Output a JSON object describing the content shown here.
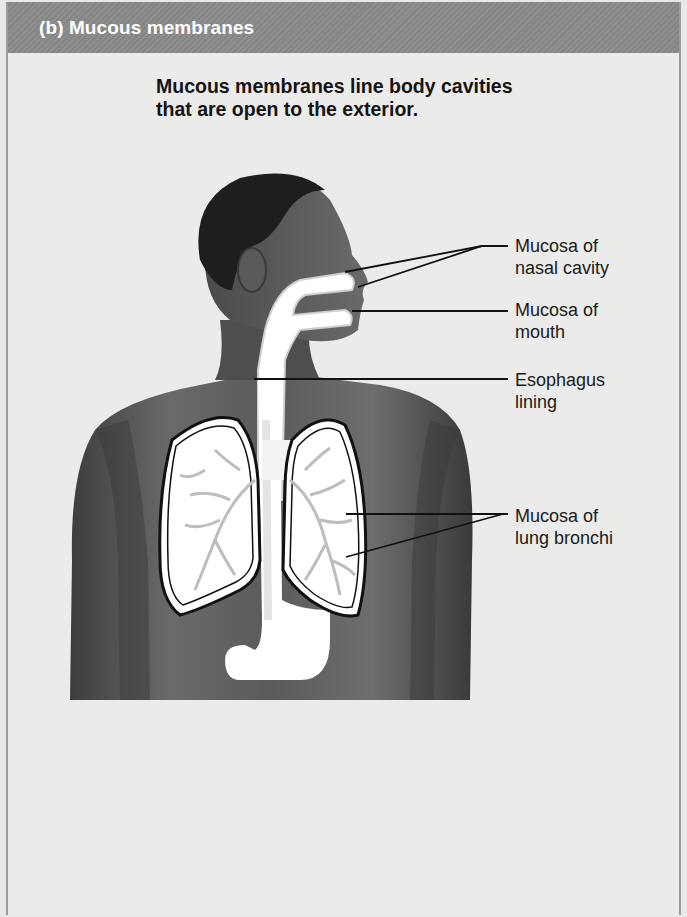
{
  "header": {
    "title": "(b) Mucous membranes",
    "background_color": "#8a8a8a"
  },
  "subtitle": {
    "line1": "Mucous membranes line body cavities",
    "line2": "that are open to the exterior."
  },
  "figure": {
    "skin_color": "#555555",
    "mucosa_color": "#ffffff",
    "bronchi_color": "#bdbdbd"
  },
  "labels": [
    {
      "id": "nasal",
      "line1": "Mucosa of",
      "line2": "nasal cavity",
      "x": 515,
      "y": 235,
      "leaders": [
        {
          "x1": 345,
          "y1": 272,
          "xm": 482,
          "ym": 246,
          "x2": 508,
          "y2": 246
        },
        {
          "x1": 358,
          "y1": 287,
          "xm": 482,
          "ym": 246,
          "x2": 508,
          "y2": 246
        }
      ]
    },
    {
      "id": "mouth",
      "line1": "Mucosa of",
      "line2": "mouth",
      "x": 515,
      "y": 299,
      "leaders": [
        {
          "x1": 352,
          "y1": 311,
          "xm": 430,
          "ym": 311,
          "x2": 508,
          "y2": 311
        }
      ]
    },
    {
      "id": "esophagus",
      "line1": "Esophagus",
      "line2": "lining",
      "x": 515,
      "y": 369,
      "leaders": [
        {
          "x1": 254,
          "y1": 379,
          "xm": 380,
          "ym": 379,
          "x2": 508,
          "y2": 379
        }
      ]
    },
    {
      "id": "bronchi",
      "line1": "Mucosa of",
      "line2": "lung bronchi",
      "x": 515,
      "y": 505,
      "leaders": [
        {
          "x1": 346,
          "y1": 514,
          "xm": 503,
          "ym": 514,
          "x2": 508,
          "y2": 514
        },
        {
          "x1": 346,
          "y1": 557,
          "xm": 503,
          "ym": 514,
          "x2": 508,
          "y2": 514
        }
      ]
    }
  ]
}
